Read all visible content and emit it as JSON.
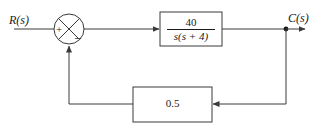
{
  "diagram": {
    "signals": {
      "input_label": "R(s)",
      "output_label": "C(s)"
    },
    "summing_junction": {
      "name": "summing-junction",
      "input_sign": "+",
      "feedback_sign": "−",
      "shape": "circle-with-cross"
    },
    "forward_block": {
      "name": "forward-transfer-function",
      "numerator": "40",
      "denominator": "s(s + 4)"
    },
    "feedback_block": {
      "name": "feedback-gain",
      "value": "0.5"
    },
    "colors": {
      "line": "#3a3a3a",
      "text": "#1a1a1a",
      "background": "#ffffff"
    }
  }
}
